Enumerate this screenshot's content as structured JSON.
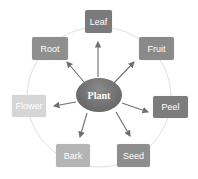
{
  "diagram": {
    "center": {
      "label": "Plant",
      "color": "#6d6d6d"
    },
    "nodes": [
      {
        "label": "Leaf",
        "color": "#7b7b7b"
      },
      {
        "label": "Fruit",
        "color": "#8a8a8a"
      },
      {
        "label": "Peel",
        "color": "#7c7c7c"
      },
      {
        "label": "Seed",
        "color": "#8e8e8e"
      },
      {
        "label": "Bark",
        "color": "#b4b4b4"
      },
      {
        "label": "Flower",
        "color": "#d6d6d6"
      },
      {
        "label": "Root",
        "color": "#8f8f8f"
      }
    ],
    "ring_color": "#dedede",
    "arrow_color": "#6f6f6f"
  }
}
